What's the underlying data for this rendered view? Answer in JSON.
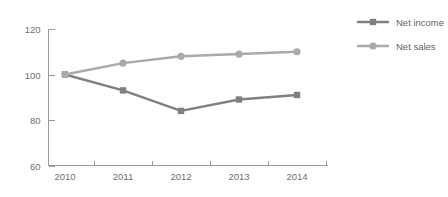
{
  "chart_data": {
    "type": "line",
    "title": "",
    "subtitle": "",
    "xlabel": "",
    "ylabel": "",
    "categories": [
      "2010",
      "2011",
      "2012",
      "2013",
      "2014"
    ],
    "series": [
      {
        "name": "Net income",
        "marker": "square",
        "color": "#808080",
        "values": [
          100,
          93,
          84,
          89,
          91
        ]
      },
      {
        "name": "Net sales",
        "marker": "circle",
        "color": "#aaaaaa",
        "values": [
          100,
          105,
          108,
          109,
          110
        ]
      }
    ],
    "ylim": [
      60,
      120
    ],
    "yticks": [
      60,
      80,
      100,
      120
    ],
    "ytick_labels": [
      "60",
      "80",
      "100",
      "120"
    ],
    "grid": false,
    "legend_position": "right",
    "axis_color": "#9b9b9b",
    "text_color": "#6e6e6e",
    "background": "#ffffff"
  },
  "legend": {
    "entries": [
      {
        "label": "Net income"
      },
      {
        "label": "Net sales"
      }
    ]
  }
}
